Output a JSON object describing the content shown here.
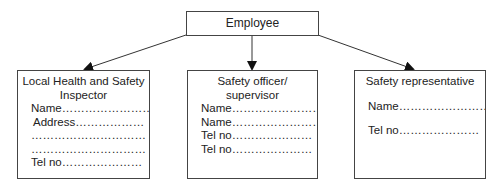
{
  "root": {
    "label": "Employee"
  },
  "boxes": {
    "left": {
      "title_line1": "Local Health and Safety",
      "title_line2": "Inspector",
      "lines": [
        "Name……………………",
        "Address………………",
        "…………………………",
        "…………………………",
        "Tel no…………………"
      ]
    },
    "middle": {
      "title_line1": "Safety officer/",
      "title_line2": "supervisor",
      "lines": [
        "Name……………………",
        "Name……………………",
        "Tel no…………………",
        "Tel no…………………"
      ]
    },
    "right": {
      "title_line1": "Safety representative",
      "lines": [
        "Name……………………",
        "Tel no…………………"
      ]
    }
  },
  "colors": {
    "stroke": "#444444",
    "text": "#222222",
    "background": "#ffffff"
  }
}
